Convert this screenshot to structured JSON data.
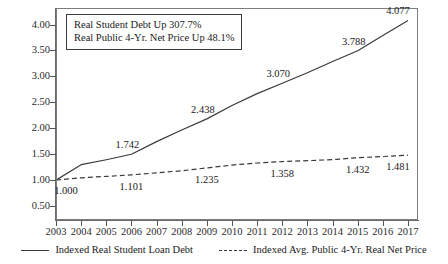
{
  "chart_data": {
    "type": "line",
    "title": "",
    "xlabel": "",
    "ylabel": "",
    "categories": [
      "2003",
      "2004",
      "2005",
      "2006",
      "2007",
      "2008",
      "2009",
      "2010",
      "2011",
      "2012",
      "2013",
      "2014",
      "2015",
      "2016",
      "2017"
    ],
    "x": [
      2003,
      2004,
      2005,
      2006,
      2007,
      2008,
      2009,
      2010,
      2011,
      2012,
      2013,
      2014,
      2015,
      2016,
      2017
    ],
    "xlim": [
      2003,
      2017
    ],
    "ylim": [
      0.25,
      4.3
    ],
    "yticks": [
      "0.50",
      "1.00",
      "1.50",
      "2.00",
      "2.50",
      "3.00",
      "3.50",
      "4.00"
    ],
    "ytick_values": [
      0.5,
      1.0,
      1.5,
      2.0,
      2.5,
      3.0,
      3.5,
      4.0
    ],
    "grid": false,
    "legend_position": "bottom",
    "series": [
      {
        "name": "Indexed Real Student Loan Debt",
        "style": "solid",
        "color": "#3a3a3a",
        "values": [
          1.0,
          1.298,
          1.393,
          1.499,
          1.742,
          1.966,
          2.181,
          2.438,
          2.668,
          2.867,
          3.07,
          3.288,
          3.495,
          3.788,
          4.077
        ],
        "labeled_points": [
          {
            "x": 2003,
            "value": "1.000"
          },
          {
            "x": 2006,
            "value": "1.742"
          },
          {
            "x": 2009,
            "value": "2.438"
          },
          {
            "x": 2012,
            "value": "3.070"
          },
          {
            "x": 2015,
            "value": "3.788"
          },
          {
            "x": 2017,
            "value": "4.077"
          }
        ]
      },
      {
        "name": "Indexed Avg. Public 4-Yr. Real Net Price",
        "style": "dashed",
        "color": "#3a3a3a",
        "values": [
          1.0,
          1.045,
          1.072,
          1.101,
          1.14,
          1.18,
          1.235,
          1.29,
          1.33,
          1.358,
          1.375,
          1.395,
          1.432,
          1.455,
          1.481
        ],
        "labeled_points": [
          {
            "x": 2006,
            "value": "1.101"
          },
          {
            "x": 2009,
            "value": "1.235"
          },
          {
            "x": 2012,
            "value": "1.358"
          },
          {
            "x": 2015,
            "value": "1.432"
          },
          {
            "x": 2017,
            "value": "1.481"
          }
        ]
      }
    ],
    "annotations": [
      "Real Student Debt Up 307.7%",
      "Real Public 4-Yr. Net Price Up 48.1%"
    ]
  },
  "annotation_box": {
    "line1": "Real Student Debt Up 307.7%",
    "line2": "Real Public 4-Yr. Net Price Up 48.1%"
  },
  "legend": {
    "items": [
      {
        "label": "Indexed Real Student Loan Debt",
        "style": "solid"
      },
      {
        "label": "Indexed Avg. Public 4-Yr. Real Net Price",
        "style": "dashed"
      }
    ]
  },
  "axis": {
    "y_labels": [
      "4.00",
      "3.50",
      "3.00",
      "2.50",
      "2.00",
      "1.50",
      "1.00",
      "0.50"
    ],
    "x_labels": [
      "2003",
      "2004",
      "2005",
      "2006",
      "2007",
      "2008",
      "2009",
      "2010",
      "2011",
      "2012",
      "2013",
      "2014",
      "2015",
      "2016",
      "2017"
    ]
  },
  "colors": {
    "line": "#3a3a3a",
    "frame": "#7d7d7d",
    "text": "#1a1a1a",
    "background": "#ffffff"
  }
}
